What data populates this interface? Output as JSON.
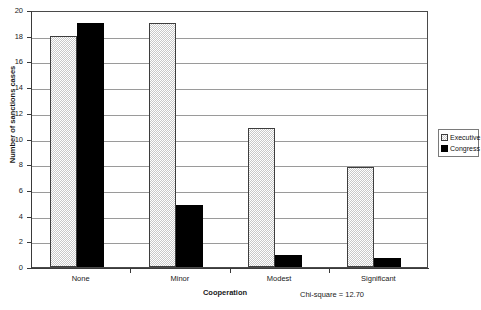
{
  "chart_data": {
    "type": "bar",
    "title": "",
    "subtitle": "",
    "xlabel": "Cooperation",
    "ylabel": "Number of sanctions cases",
    "categories": [
      "None",
      "Minor",
      "Modest",
      "Significant"
    ],
    "series": [
      {
        "name": "Executive",
        "values": [
          18,
          19,
          10.8,
          7.8
        ],
        "fill": "checker-dither",
        "color": "#d0d0d0"
      },
      {
        "name": "Congress",
        "values": [
          19,
          4.8,
          0.9,
          0.7
        ],
        "fill": "solid",
        "color": "#000000"
      }
    ],
    "ylim": [
      0,
      20
    ],
    "yticks": [
      0,
      2,
      4,
      6,
      8,
      10,
      12,
      14,
      16,
      18,
      20
    ],
    "ytick_labels": [
      "0",
      "2",
      "4",
      "6",
      "8",
      "10",
      "12",
      "14",
      "16",
      "18",
      "20"
    ],
    "grid": true,
    "grid_axis": "y",
    "legend_position": "right-outside",
    "annotations": [
      {
        "name": "chi-square",
        "text": "Chi-square = 12.70"
      }
    ]
  },
  "legend": {
    "entries": [
      {
        "label": "Executive"
      },
      {
        "label": "Congress"
      }
    ]
  },
  "colors": {
    "axis": "#3a3a3a",
    "grid": "#9a9a9a",
    "frame": "#4a4a4a",
    "executive_fill": "#d0d0d0",
    "congress_fill": "#000000",
    "text": "#1a1a1a",
    "background": "#ffffff"
  }
}
